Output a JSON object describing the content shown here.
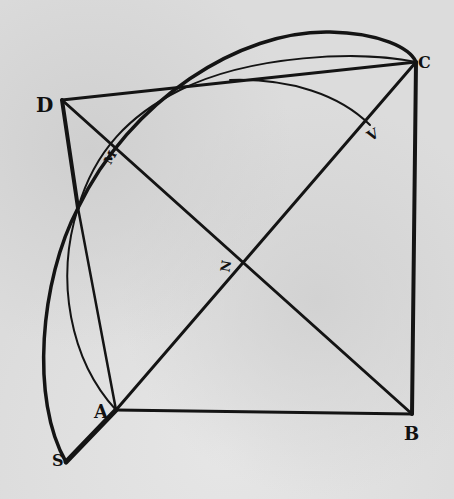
{
  "diagram": {
    "labels": {
      "D": "D",
      "C": "C",
      "M": "M",
      "V": "V",
      "N": "N",
      "A": "A",
      "B": "B",
      "S": "S"
    },
    "colors": {
      "ink": "#111111",
      "paper": "#dcdcdc"
    }
  }
}
